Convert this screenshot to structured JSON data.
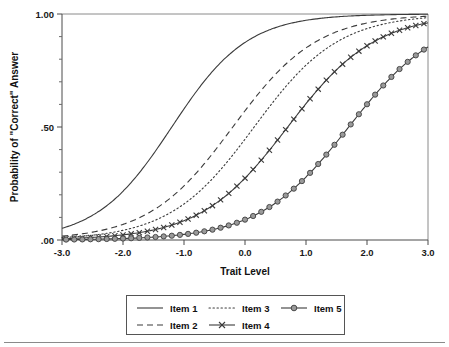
{
  "figure": {
    "background_color": "#ffffff",
    "ink_color": "#3b3b3b",
    "marker_fill_color": "#9a9a9a"
  },
  "chart_data": {
    "type": "line",
    "title": "",
    "subtitle": "",
    "xlabel": "Trait Level",
    "ylabel": "Probability of \"Correct\" Answer",
    "xlim": [
      -3.0,
      3.0
    ],
    "ylim": [
      0.0,
      1.0
    ],
    "xticks": [
      -3.0,
      -2.0,
      -1.0,
      0.0,
      1.0,
      2.0,
      3.0
    ],
    "xticklabels": [
      "-3.0",
      "-2.0",
      "-1.0",
      "0.0",
      "1.0",
      "2.0",
      "3.0"
    ],
    "yticks": [
      0.0,
      0.5,
      1.0
    ],
    "yticklabels": [
      ".00",
      ".50",
      "1.00"
    ],
    "y_minor_ticks": [
      0.1,
      0.2,
      0.3,
      0.4,
      0.6,
      0.7,
      0.8,
      0.9
    ],
    "grid": false,
    "legend_position": "below-center",
    "x": [
      -3.0,
      -2.75,
      -2.5,
      -2.25,
      -2.0,
      -1.75,
      -1.5,
      -1.25,
      -1.0,
      -0.75,
      -0.5,
      -0.25,
      0.0,
      0.25,
      0.5,
      0.75,
      1.0,
      1.25,
      1.5,
      1.75,
      2.0,
      2.25,
      2.5,
      2.75,
      3.0
    ],
    "series": [
      {
        "name": "Item 1",
        "style": "solid",
        "marker": "none",
        "difficulty": -1.2,
        "discrimination": 0.95,
        "values": [
          0.19,
          0.23,
          0.27,
          0.32,
          0.37,
          0.43,
          0.49,
          0.55,
          0.61,
          0.66,
          0.71,
          0.76,
          0.8,
          0.84,
          0.87,
          0.89,
          0.91,
          0.93,
          0.95,
          0.96,
          0.97,
          0.97,
          0.98,
          0.98,
          0.99
        ]
      },
      {
        "name": "Item 2",
        "style": "dashed",
        "marker": "none",
        "difficulty": -0.2,
        "discrimination": 0.85,
        "values": [
          0.1,
          0.12,
          0.14,
          0.17,
          0.2,
          0.24,
          0.28,
          0.33,
          0.38,
          0.44,
          0.5,
          0.56,
          0.62,
          0.67,
          0.72,
          0.77,
          0.81,
          0.85,
          0.88,
          0.9,
          0.92,
          0.94,
          0.95,
          0.96,
          0.97
        ]
      },
      {
        "name": "Item 3",
        "style": "dotted",
        "marker": "none",
        "difficulty": 0.15,
        "discrimination": 0.85,
        "values": [
          0.06,
          0.08,
          0.09,
          0.11,
          0.14,
          0.16,
          0.2,
          0.24,
          0.28,
          0.33,
          0.38,
          0.44,
          0.5,
          0.56,
          0.62,
          0.67,
          0.72,
          0.77,
          0.81,
          0.85,
          0.88,
          0.9,
          0.92,
          0.94,
          0.95
        ]
      },
      {
        "name": "Item 4",
        "style": "solid",
        "marker": "x",
        "difficulty": 0.7,
        "discrimination": 0.82,
        "values": [
          0.04,
          0.05,
          0.06,
          0.07,
          0.09,
          0.11,
          0.13,
          0.16,
          0.19,
          0.23,
          0.27,
          0.32,
          0.37,
          0.43,
          0.49,
          0.54,
          0.6,
          0.66,
          0.71,
          0.75,
          0.79,
          0.83,
          0.86,
          0.89,
          0.91
        ]
      },
      {
        "name": "Item 5",
        "style": "solid",
        "marker": "o",
        "difficulty": 1.7,
        "discrimination": 0.8,
        "values": [
          0.02,
          0.02,
          0.03,
          0.03,
          0.04,
          0.05,
          0.06,
          0.07,
          0.09,
          0.1,
          0.12,
          0.15,
          0.18,
          0.21,
          0.25,
          0.29,
          0.34,
          0.4,
          0.45,
          0.51,
          0.57,
          0.63,
          0.69,
          0.75,
          0.81
        ]
      }
    ]
  },
  "legend": {
    "entries": [
      {
        "label": "Item 1",
        "style": "solid",
        "marker": "none",
        "col": 0,
        "row": 0
      },
      {
        "label": "Item 2",
        "style": "dashed",
        "marker": "none",
        "col": 0,
        "row": 1
      },
      {
        "label": "Item 3",
        "style": "dotted",
        "marker": "none",
        "col": 1,
        "row": 0
      },
      {
        "label": "Item 4",
        "style": "solid",
        "marker": "x",
        "col": 1,
        "row": 1
      },
      {
        "label": "Item 5",
        "style": "solid",
        "marker": "o",
        "col": 2,
        "row": 0
      }
    ]
  }
}
